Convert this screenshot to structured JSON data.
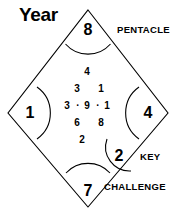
{
  "title": "Year",
  "corners": {
    "top": {
      "number": "8",
      "label": "PENTACLE"
    },
    "left": {
      "number": "1",
      "label": ""
    },
    "right": {
      "number": "4",
      "label": ""
    },
    "bottom": {
      "number": "7",
      "label": "CHALLENGE"
    },
    "key": {
      "number": "2",
      "label": "KEY"
    }
  },
  "center_grid": {
    "row1": {
      "c1": "4"
    },
    "row2": {
      "c1": "3",
      "c2": "1"
    },
    "row3": {
      "c1": "3",
      "d1": "·",
      "c2": "9",
      "d2": "·",
      "c3": "1"
    },
    "row4": {
      "c1": "6",
      "c2": "8"
    },
    "row5": {
      "c1": "2"
    }
  },
  "colors": {
    "stroke": "#000000",
    "background": "#ffffff",
    "text": "#000000"
  }
}
